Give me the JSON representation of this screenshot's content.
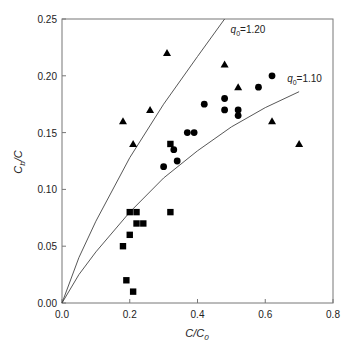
{
  "chart_data": {
    "type": "scatter",
    "title": "",
    "xlabel": "C/C0",
    "ylabel": "Cb/C",
    "xlim": [
      0,
      0.8
    ],
    "ylim": [
      0,
      0.25
    ],
    "xticks": [
      "0.0",
      "0.2",
      "0.4",
      "0.6",
      "0.8"
    ],
    "yticks": [
      "0.00",
      "0.05",
      "0.10",
      "0.15",
      "0.20",
      "0.25"
    ],
    "grid": false,
    "legend": null,
    "series": [
      {
        "name": "triangles",
        "marker": "triangle",
        "points": [
          [
            0.18,
            0.16
          ],
          [
            0.21,
            0.14
          ],
          [
            0.26,
            0.17
          ],
          [
            0.31,
            0.22
          ],
          [
            0.48,
            0.21
          ],
          [
            0.52,
            0.19
          ],
          [
            0.62,
            0.16
          ],
          [
            0.7,
            0.14
          ]
        ]
      },
      {
        "name": "circles",
        "marker": "circle",
        "points": [
          [
            0.3,
            0.12
          ],
          [
            0.33,
            0.135
          ],
          [
            0.34,
            0.125
          ],
          [
            0.37,
            0.15
          ],
          [
            0.39,
            0.15
          ],
          [
            0.42,
            0.175
          ],
          [
            0.48,
            0.18
          ],
          [
            0.48,
            0.17
          ],
          [
            0.52,
            0.17
          ],
          [
            0.52,
            0.165
          ],
          [
            0.58,
            0.19
          ],
          [
            0.62,
            0.2
          ]
        ]
      },
      {
        "name": "squares",
        "marker": "square",
        "points": [
          [
            0.18,
            0.05
          ],
          [
            0.19,
            0.02
          ],
          [
            0.2,
            0.06
          ],
          [
            0.2,
            0.08
          ],
          [
            0.21,
            0.01
          ],
          [
            0.22,
            0.08
          ],
          [
            0.22,
            0.07
          ],
          [
            0.24,
            0.07
          ],
          [
            0.32,
            0.08
          ],
          [
            0.32,
            0.14
          ]
        ]
      }
    ],
    "curves": [
      {
        "label": "q0=1.20",
        "label_main": "q",
        "label_sub": "0",
        "label_value": "=1.20",
        "points": [
          [
            0,
            0
          ],
          [
            0.05,
            0.04
          ],
          [
            0.1,
            0.072
          ],
          [
            0.2,
            0.128
          ],
          [
            0.3,
            0.175
          ],
          [
            0.4,
            0.217
          ],
          [
            0.48,
            0.25
          ]
        ]
      },
      {
        "label": "q0=1.10",
        "label_main": "q",
        "label_sub": "0",
        "label_value": "=1.10",
        "points": [
          [
            0,
            0
          ],
          [
            0.05,
            0.025
          ],
          [
            0.1,
            0.045
          ],
          [
            0.2,
            0.08
          ],
          [
            0.3,
            0.11
          ],
          [
            0.4,
            0.134
          ],
          [
            0.5,
            0.155
          ],
          [
            0.6,
            0.172
          ],
          [
            0.7,
            0.186
          ]
        ]
      }
    ],
    "annotations": [
      "q0=1.20",
      "q0=1.10"
    ]
  },
  "axes": {
    "xlabel_main": "C/C",
    "xlabel_sub": "0",
    "ylabel_main": "C",
    "ylabel_sub": "b",
    "ylabel_tail": "/C"
  }
}
